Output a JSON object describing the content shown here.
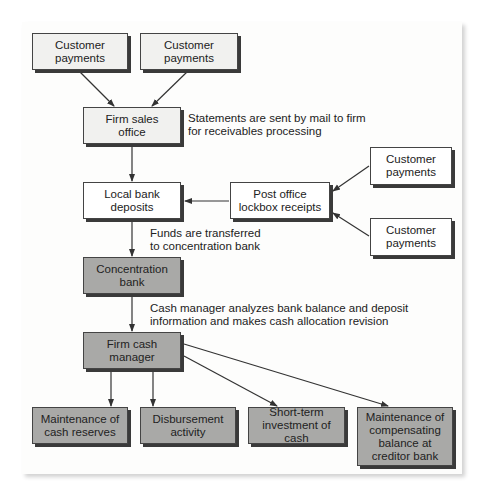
{
  "diagram": {
    "type": "flowchart",
    "colors": {
      "light_box": "#f1f1ef",
      "white_box": "#ffffff",
      "dark_box": "#a9a9a7",
      "line": "#333333"
    },
    "nodes": {
      "customer_1": "Customer payments",
      "customer_2": "Customer payments",
      "firm_sales_office": "Firm sales office",
      "local_bank_deposits": "Local bank deposits",
      "post_office_lockbox": "Post office lockbox receipts",
      "customer_3": "Customer payments",
      "customer_4": "Customer payments",
      "concentration_bank": "Concentration bank",
      "firm_cash_manager": "Firm cash manager",
      "cash_reserves": "Maintenance of cash reserves",
      "disbursement": "Disbursement activity",
      "short_term_investment": "Short-term investment of cash",
      "compensating_balance": "Maintenance of compensating balance at creditor bank"
    },
    "lines": {
      "customer_1_l1": "Customer",
      "customer_1_l2": "payments",
      "customer_2_l1": "Customer",
      "customer_2_l2": "payments",
      "firm_sales_l1": "Firm sales",
      "firm_sales_l2": "office",
      "local_bank_l1": "Local bank",
      "local_bank_l2": "deposits",
      "lockbox_l1": "Post office",
      "lockbox_l2": "lockbox receipts",
      "customer_3_l1": "Customer",
      "customer_3_l2": "payments",
      "customer_4_l1": "Customer",
      "customer_4_l2": "payments",
      "concentration_l1": "Concentration",
      "concentration_l2": "bank",
      "cash_manager_l1": "Firm cash",
      "cash_manager_l2": "manager",
      "reserves_l1": "Maintenance of",
      "reserves_l2": "cash reserves",
      "disbursement_l1": "Disbursement",
      "disbursement_l2": "activity",
      "investment_l1": "Short-term",
      "investment_l2": "investment of cash",
      "compensating_l1": "Maintenance of",
      "compensating_l2": "compensating",
      "compensating_l3": "balance at",
      "compensating_l4": "creditor bank"
    },
    "notes": {
      "statements_l1": "Statements are sent by mail to firm",
      "statements_l2": "for receivables processing",
      "funds_l1": "Funds are transferred",
      "funds_l2": "to concentration bank",
      "analysis_l1": "Cash manager analyzes bank balance and deposit",
      "analysis_l2": "information and makes cash allocation revision"
    },
    "edges": [
      [
        "customer_1",
        "firm_sales_office"
      ],
      [
        "customer_2",
        "firm_sales_office"
      ],
      [
        "firm_sales_office",
        "local_bank_deposits"
      ],
      [
        "customer_3",
        "post_office_lockbox"
      ],
      [
        "customer_4",
        "post_office_lockbox"
      ],
      [
        "post_office_lockbox",
        "local_bank_deposits"
      ],
      [
        "local_bank_deposits",
        "concentration_bank"
      ],
      [
        "concentration_bank",
        "firm_cash_manager"
      ],
      [
        "firm_cash_manager",
        "cash_reserves"
      ],
      [
        "firm_cash_manager",
        "disbursement"
      ],
      [
        "firm_cash_manager",
        "short_term_investment"
      ],
      [
        "firm_cash_manager",
        "compensating_balance"
      ]
    ]
  }
}
